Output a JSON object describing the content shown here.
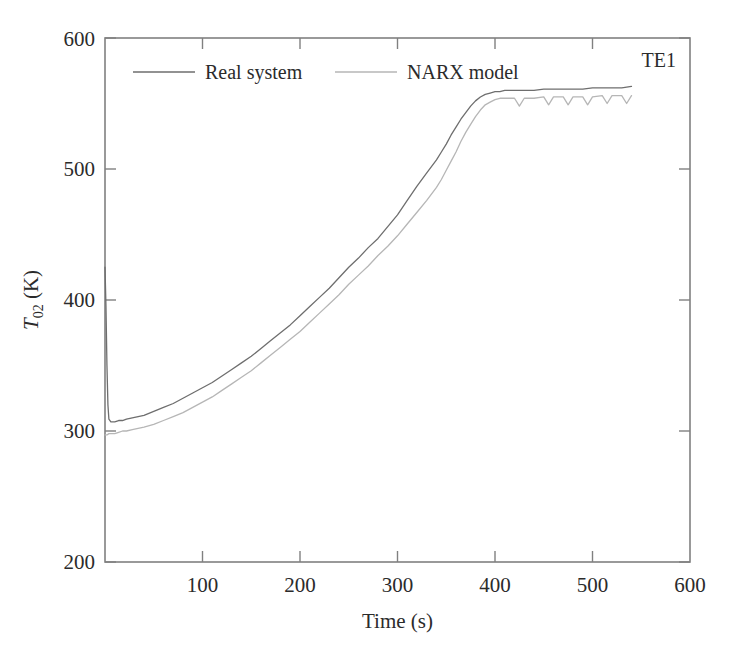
{
  "chart_data": {
    "type": "line",
    "title": "",
    "annotation": "TE1",
    "xlabel": "Time (s)",
    "ylabel_main": "T",
    "ylabel_sub": "02",
    "ylabel_unit": " (K)",
    "ylabel_full": "T02 (K)",
    "xlim": [
      0,
      600
    ],
    "ylim": [
      200,
      600
    ],
    "xticks": [
      0,
      100,
      200,
      300,
      400,
      500,
      600
    ],
    "xtick_labels": [
      "",
      "100",
      "200",
      "300",
      "400",
      "500",
      "600"
    ],
    "yticks": [
      200,
      300,
      400,
      500,
      600
    ],
    "ytick_labels": [
      "200",
      "300",
      "400",
      "500",
      "600"
    ],
    "grid": false,
    "legend_position": "top-center-inside",
    "series": [
      {
        "name": "Real system",
        "color": "#6e6e6e",
        "x": [
          0,
          1,
          2,
          3,
          4,
          6,
          8,
          10,
          14,
          18,
          22,
          28,
          34,
          40,
          50,
          60,
          70,
          80,
          90,
          100,
          110,
          120,
          130,
          140,
          150,
          160,
          170,
          180,
          190,
          200,
          210,
          220,
          230,
          240,
          250,
          260,
          270,
          280,
          290,
          300,
          310,
          320,
          330,
          340,
          345,
          350,
          355,
          360,
          365,
          370,
          375,
          380,
          385,
          390,
          395,
          400,
          405,
          410,
          415,
          420,
          430,
          440,
          450,
          460,
          470,
          480,
          490,
          500,
          510,
          520,
          530,
          540
        ],
        "y": [
          425,
          395,
          350,
          320,
          309,
          307,
          307,
          307,
          308,
          308,
          309,
          310,
          311,
          312,
          315,
          318,
          321,
          325,
          329,
          333,
          337,
          342,
          347,
          352,
          357,
          363,
          369,
          375,
          381,
          388,
          395,
          402,
          409,
          417,
          425,
          432,
          440,
          447,
          456,
          465,
          476,
          487,
          497,
          507,
          513,
          519,
          526,
          532,
          538,
          543,
          548,
          552,
          555,
          557,
          558,
          559,
          559,
          560,
          560,
          560,
          560,
          560,
          561,
          561,
          561,
          561,
          561,
          562,
          562,
          562,
          562,
          563
        ]
      },
      {
        "name": "NARX model",
        "color": "#b6b6b6",
        "x": [
          0,
          2,
          4,
          6,
          8,
          10,
          14,
          18,
          22,
          28,
          34,
          40,
          50,
          60,
          70,
          80,
          90,
          100,
          110,
          120,
          130,
          140,
          150,
          160,
          170,
          180,
          190,
          200,
          210,
          220,
          230,
          240,
          250,
          260,
          270,
          280,
          290,
          300,
          310,
          320,
          330,
          340,
          345,
          350,
          355,
          360,
          365,
          370,
          375,
          380,
          385,
          390,
          395,
          400,
          405,
          410,
          415,
          420,
          425,
          430,
          440,
          450,
          455,
          460,
          470,
          475,
          480,
          490,
          495,
          500,
          510,
          515,
          520,
          530,
          535,
          540
        ],
        "y": [
          297,
          297,
          298,
          298,
          298,
          298,
          299,
          300,
          300,
          301,
          302,
          303,
          305,
          308,
          311,
          314,
          318,
          322,
          326,
          331,
          336,
          341,
          346,
          352,
          358,
          364,
          370,
          376,
          383,
          390,
          397,
          404,
          412,
          419,
          426,
          434,
          441,
          449,
          458,
          467,
          476,
          486,
          492,
          499,
          506,
          513,
          521,
          528,
          534,
          540,
          545,
          549,
          551,
          553,
          554,
          554,
          554,
          554,
          548,
          554,
          554,
          555,
          549,
          555,
          555,
          549,
          555,
          555,
          549,
          555,
          556,
          550,
          556,
          556,
          550,
          556
        ]
      }
    ]
  },
  "legend": {
    "entries": [
      {
        "label": "Real system",
        "color": "#6e6e6e"
      },
      {
        "label": "NARX model",
        "color": "#b6b6b6"
      }
    ]
  },
  "axes": {
    "x_title": "Time (s)",
    "y_title_t": "T",
    "y_title_sub": "02",
    "y_title_unit": " (K)"
  },
  "annotation": {
    "text": "TE1"
  }
}
